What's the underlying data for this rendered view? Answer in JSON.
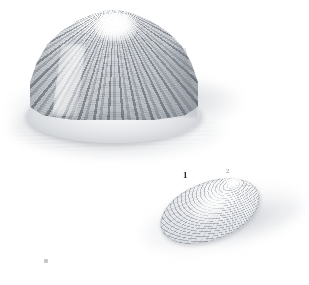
{
  "plate": {
    "medium": "grayscale natural-history shell illustration",
    "background_color": "#ffffff",
    "width": 309,
    "height": 285
  },
  "palette": {
    "paper": "#ffffff",
    "shell_light": "#f6f7f8",
    "shell_mid": "#c8ccd1",
    "shell_dark": "#787e86",
    "outline": "#6c727a",
    "ground_wash": "#c4c7cb",
    "shadow": "#b2b6bc",
    "label_ink": "#2b2b2d"
  },
  "figures": [
    {
      "id": "figure-1",
      "label": "1",
      "common_name": "conical ribbed limpet shell",
      "view": "lateral / three-quarter, apex up",
      "form": "tall cone",
      "sculpture": "strong radial ribs crossed by fine concentric growth lines",
      "apex_position": "central, highlighted white",
      "base": "broad elliptical aperture rim",
      "shadow": "soft cast shadow to lower left on striated ground"
    },
    {
      "id": "figure-2",
      "label": "2",
      "common_name": "flattened oval limpet shell",
      "view": "dorsal, tilted",
      "form": "low ellipse",
      "sculpture": "concentric growth rings radiating from an off-centre apex",
      "apex_position": "upper right of the oval",
      "base": "entire oval margin",
      "shadow": "soft diagonal cast shadow to the right"
    }
  ],
  "labels": {
    "figure_one": "1",
    "figure_two": "2"
  },
  "artifacts": {
    "speck_note": "faint ink speck near lower left of plate"
  }
}
